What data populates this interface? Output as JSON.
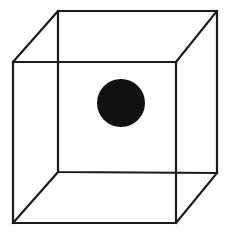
{
  "figure": {
    "canvas": {
      "width": 231,
      "height": 239,
      "background_color": "#ffffff"
    },
    "style": {
      "edge_color": "#1a1a1a",
      "edge_width": 2.2,
      "sphere_color": "#111111"
    },
    "cube": {
      "name": "wireframe-cube",
      "front_face": {
        "name": "front-face",
        "top_left": [
          13,
          62
        ],
        "top_right": [
          176,
          62
        ],
        "bottom_right": [
          176,
          223
        ],
        "bottom_left": [
          13,
          223
        ]
      },
      "back_face": {
        "name": "back-face",
        "top_left": [
          58,
          11
        ],
        "top_right": [
          217,
          11
        ],
        "bottom_right": [
          217,
          173
        ],
        "bottom_left": [
          58,
          172
        ]
      },
      "edges": [
        {
          "name": "front-top-edge",
          "from": [
            13,
            62
          ],
          "to": [
            176,
            62
          ]
        },
        {
          "name": "front-right-edge",
          "from": [
            176,
            62
          ],
          "to": [
            176,
            223
          ]
        },
        {
          "name": "front-bottom-edge",
          "from": [
            176,
            223
          ],
          "to": [
            13,
            223
          ]
        },
        {
          "name": "front-left-edge",
          "from": [
            13,
            223
          ],
          "to": [
            13,
            62
          ]
        },
        {
          "name": "back-top-edge",
          "from": [
            58,
            11
          ],
          "to": [
            217,
            11
          ]
        },
        {
          "name": "back-right-edge",
          "from": [
            217,
            11
          ],
          "to": [
            217,
            173
          ]
        },
        {
          "name": "back-bottom-edge",
          "from": [
            217,
            173
          ],
          "to": [
            58,
            172
          ]
        },
        {
          "name": "back-left-edge",
          "from": [
            58,
            172
          ],
          "to": [
            58,
            11
          ]
        },
        {
          "name": "connector-top-left",
          "from": [
            13,
            62
          ],
          "to": [
            58,
            11
          ]
        },
        {
          "name": "connector-top-right",
          "from": [
            176,
            62
          ],
          "to": [
            217,
            11
          ]
        },
        {
          "name": "connector-bottom-right",
          "from": [
            176,
            223
          ],
          "to": [
            217,
            173
          ]
        },
        {
          "name": "connector-bottom-left",
          "from": [
            13,
            223
          ],
          "to": [
            58,
            172
          ]
        }
      ],
      "paths": {
        "front_face_path": "M 13 62 L 176 62 L 176 223 L 13 223 Z",
        "back_face_path": "M 58 11 L 217 11 L 217 173 L 58 172 Z",
        "connector_top_left_path": "M 13 62 L 58 11",
        "connector_top_right_path": "M 176 62 L 217 11",
        "connector_bottom_right_path": "M 176 223 L 217 173",
        "connector_bottom_left_path": "M 13 223 L 58 172"
      }
    },
    "sphere": {
      "name": "center-sphere",
      "shape": "circle",
      "center_x": 121,
      "center_y": 103,
      "radius": 24,
      "fill": "#111111"
    }
  }
}
